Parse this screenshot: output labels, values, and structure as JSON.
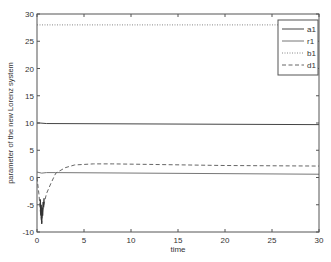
{
  "chart_data": {
    "type": "line",
    "title": "",
    "xlabel": "time",
    "ylabel": "parameter of the new Lorenz system",
    "xlim": [
      0,
      30
    ],
    "ylim": [
      -10,
      30
    ],
    "xticks": [
      0,
      5,
      10,
      15,
      20,
      25,
      30
    ],
    "yticks": [
      -10,
      -5,
      0,
      5,
      10,
      15,
      20,
      25,
      30
    ],
    "grid": false,
    "legend_position": "upper right",
    "series": [
      {
        "name": "a1",
        "style": "solid",
        "x": [
          0,
          0.3,
          1,
          30
        ],
        "y": [
          10,
          10,
          9.9,
          9.7
        ]
      },
      {
        "name": "r1",
        "style": "solid",
        "x": [
          0,
          0.5,
          1,
          2,
          30
        ],
        "y": [
          1,
          0.8,
          0.9,
          0.9,
          0.6
        ]
      },
      {
        "name": "b1",
        "style": "dotted",
        "x": [
          0,
          30
        ],
        "y": [
          28,
          28
        ]
      },
      {
        "name": "d1",
        "style": "dashed",
        "x": [
          0,
          0.2,
          0.4,
          0.5,
          0.6,
          0.8,
          1.0,
          1.5,
          2,
          3,
          4,
          6,
          8,
          12,
          20,
          30
        ],
        "y": [
          0,
          -3,
          -7,
          -8.5,
          -6,
          -4.5,
          -3,
          -1,
          0.8,
          1.8,
          2.3,
          2.5,
          2.5,
          2.4,
          2.2,
          2.1
        ]
      }
    ]
  }
}
